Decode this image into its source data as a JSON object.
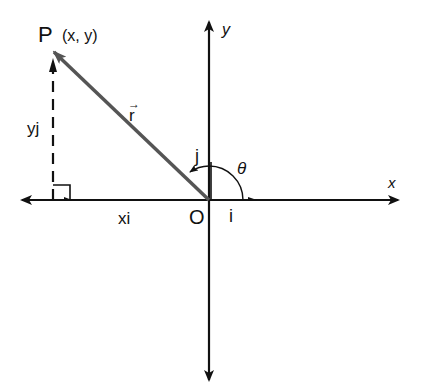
{
  "diagram": {
    "point_label": "P",
    "point_coords": "(x, y)",
    "vector_label": "r",
    "x_component_label": "xi",
    "y_component_label": "yj",
    "origin_label": "O",
    "x_axis_label": "x",
    "y_axis_label": "y",
    "unit_i_label": "i",
    "unit_j_label": "j",
    "angle_label": "θ",
    "colors": {
      "axes": "#111111",
      "vector": "#555555",
      "dashed": "#111111"
    }
  }
}
